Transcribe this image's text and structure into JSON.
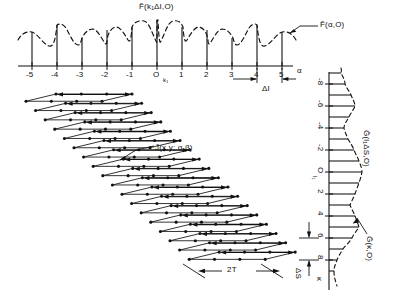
{
  "figure": {
    "title_absent": "",
    "top_panel": {
      "envelope_label": "F̃(α,O)",
      "spike_label": "F̃(k₁ΔI,O)",
      "axis_label": "α",
      "origin_sub_label": "k₁",
      "spacing_label": "ΔI",
      "ticks": [
        "-5",
        "-4",
        "-3",
        "-2",
        "-1",
        "O",
        "1",
        "2",
        "3",
        "4",
        "5"
      ]
    },
    "center_panel": {
      "band_label": "J̃(x,y; α,β)",
      "width_label": "2T"
    },
    "right_panel": {
      "spike_label": "G̃(l₁ΔS,O)",
      "envelope_label": "G̃(κ,O)",
      "axis_label": "κ",
      "origin_sub_label": "l₁",
      "spacing_label": "ΔS",
      "ticks": [
        "-8",
        "-6",
        "-4",
        "-2",
        "O",
        "2",
        "4",
        "6",
        "8"
      ]
    },
    "colors": {
      "ink": "#111111",
      "paper": "#ffffff"
    }
  },
  "chart_data": [
    {
      "type": "line",
      "name": "top-spectrum",
      "title": "F̃(k₁ΔI,O) sampled spectrum with envelope F̃(α,O)",
      "xlabel": "α",
      "ylabel": "",
      "xlim": [
        -5.8,
        5.8
      ],
      "ylim": [
        0,
        1.05
      ],
      "grid": false,
      "legend": "none",
      "sample_x": [
        -5,
        -4,
        -3,
        -2,
        -1,
        0,
        1,
        2,
        3,
        4,
        5
      ],
      "sample_values": [
        0.74,
        0.88,
        0.62,
        0.78,
        0.84,
        1.0,
        0.84,
        0.78,
        0.62,
        0.88,
        0.74
      ],
      "envelope_note": "dashed oscillatory envelope touching each spike tip",
      "xticks": [
        -5,
        -4,
        -3,
        -2,
        -1,
        0,
        1,
        2,
        3,
        4,
        5
      ],
      "xticklabels": [
        "-5",
        "-4",
        "-3",
        "-2",
        "-1",
        "O",
        "1",
        "2",
        "3",
        "4",
        "5"
      ],
      "annotations": [
        "ΔI sample spacing between α = 4 and α = 5"
      ]
    },
    {
      "type": "line",
      "name": "right-spectrum",
      "title": "G̃(l₁ΔS,O) sampled spectrum with envelope G̃(κ,O)",
      "xlabel": "κ",
      "ylabel": "",
      "xlim": [
        -9.5,
        9.5
      ],
      "ylim": [
        0,
        1.05
      ],
      "grid": false,
      "legend": "none",
      "orientation": "vertical-rotated-90",
      "sample_x": [
        -9,
        -8,
        -7,
        -6,
        -5,
        -4,
        -3,
        -2,
        -1,
        0,
        1,
        2,
        3,
        4,
        5,
        6,
        7,
        8,
        9
      ],
      "sample_values": [
        0.34,
        0.46,
        0.62,
        0.74,
        0.58,
        0.44,
        0.56,
        0.72,
        0.86,
        0.95,
        0.86,
        0.74,
        0.6,
        0.72,
        0.86,
        0.7,
        0.5,
        0.36,
        0.26
      ],
      "envelope_note": "dashed envelope tracing the spike tips",
      "xticks": [
        -8,
        -6,
        -4,
        -2,
        0,
        2,
        4,
        6,
        8
      ],
      "xticklabels": [
        "-8",
        "-6",
        "-4",
        "-2",
        "O",
        "2",
        "4",
        "6",
        "8"
      ],
      "annotations": [
        "ΔS sample spacing between κ = 6 and κ = 8"
      ]
    },
    {
      "type": "diagram",
      "name": "center-band",
      "title": "J̃(x,y; α,β) tilted band of stacked sampling cells",
      "rows": 18,
      "cells_per_row": 3,
      "width_label": "2T",
      "description": "Diagonal strip composed of stacked thin parallelogram cells, each with filled node dots and a horizontal double arrow"
    }
  ]
}
